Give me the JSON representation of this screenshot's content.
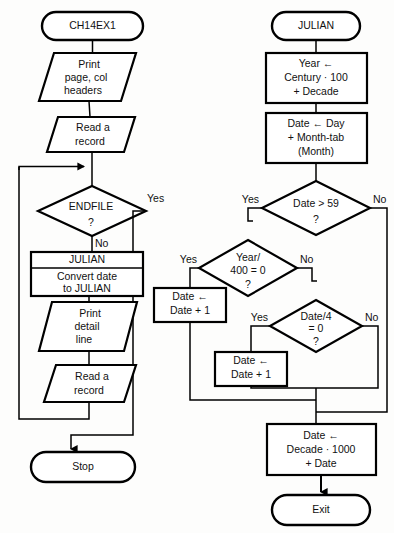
{
  "figure": {
    "kind": "flowchart-pair",
    "background_color": "#fdfdfc",
    "line_color": "#000000",
    "fill_color": "#ffffff"
  },
  "left_chart": {
    "name": "main-program-flowchart",
    "start_label": "CH14EX1",
    "nodes": {
      "print_headers_line1": "Print",
      "print_headers_line2": "page, col",
      "print_headers_line3": "headers",
      "read_record_1_line1": "Read a",
      "read_record_1_line2": "record",
      "endfile_line1": "ENDFILE",
      "endfile_line2": "?",
      "julian_call_header": "JULIAN",
      "julian_call_line1": "Convert date",
      "julian_call_line2": "to JULIAN",
      "print_detail_line1": "Print",
      "print_detail_line2": "detail",
      "print_detail_line3": "line",
      "read_record_2_line1": "Read a",
      "read_record_2_line2": "record",
      "stop_label": "Stop"
    },
    "branch_labels": {
      "endfile_yes": "Yes",
      "endfile_no": "No"
    }
  },
  "right_chart": {
    "name": "julian-subroutine-flowchart",
    "start_label": "JULIAN",
    "nodes": {
      "year_calc_line1": "Year ←",
      "year_calc_line2": "Century · 100",
      "year_calc_line3": "+ Decade",
      "date_calc_line1": "Date ← Day",
      "date_calc_line2": "+ Month-tab",
      "date_calc_line3": "(Month)",
      "date_gt_59_line1": "Date > 59",
      "date_gt_59_line2": "?",
      "year_400_line1": "Year/",
      "year_400_line2": "400 = 0",
      "year_400_line3": "?",
      "date_inc_a_line1": "Date ←",
      "date_inc_a_line2": "Date + 1",
      "date_div_4_line1": "Date/4",
      "date_div_4_line2": "= 0",
      "date_div_4_line3": "?",
      "date_inc_b_line1": "Date ←",
      "date_inc_b_line2": "Date + 1",
      "final_calc_line1": "Date ←",
      "final_calc_line2": "Decade · 1000",
      "final_calc_line3": "+ Date",
      "exit_label": "Exit"
    },
    "branch_labels": {
      "date_gt_59_yes": "Yes",
      "date_gt_59_no": "No",
      "year_400_yes": "Yes",
      "year_400_no": "No",
      "date_div_4_yes": "Yes",
      "date_div_4_no": "No"
    }
  }
}
